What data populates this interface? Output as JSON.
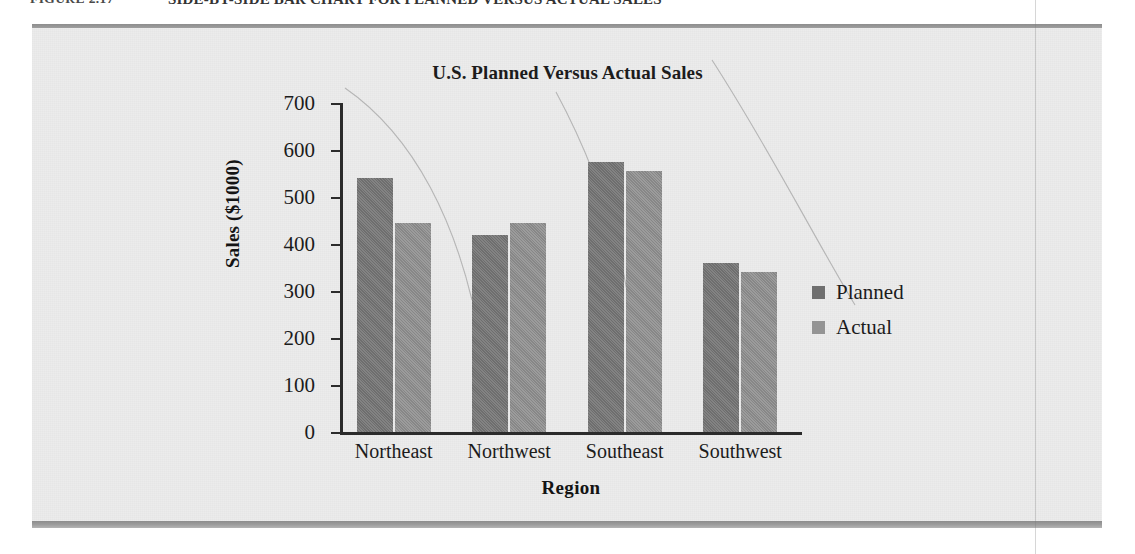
{
  "caption": {
    "label": "FIGURE 2.17",
    "title": "SIDE-BY-SIDE BAR CHART FOR PLANNED VERSUS ACTUAL SALES"
  },
  "chart_data": {
    "type": "bar",
    "title": "U.S. Planned Versus Actual Sales",
    "xlabel": "Region",
    "ylabel": "Sales ($1000)",
    "categories": [
      "Northeast",
      "Northwest",
      "Southeast",
      "Southwest"
    ],
    "series": [
      {
        "name": "Planned",
        "color": "#757575",
        "values": [
          540,
          420,
          575,
          360
        ]
      },
      {
        "name": "Actual",
        "color": "#8e8e8e",
        "values": [
          445,
          445,
          555,
          340
        ]
      }
    ],
    "ylim": [
      0,
      700
    ],
    "yticks": [
      0,
      100,
      200,
      300,
      400,
      500,
      600,
      700
    ],
    "ytick_labels": [
      "0",
      "100",
      "200",
      "300",
      "400",
      "500",
      "600",
      "700"
    ],
    "grid": false,
    "legend_position": "right"
  }
}
